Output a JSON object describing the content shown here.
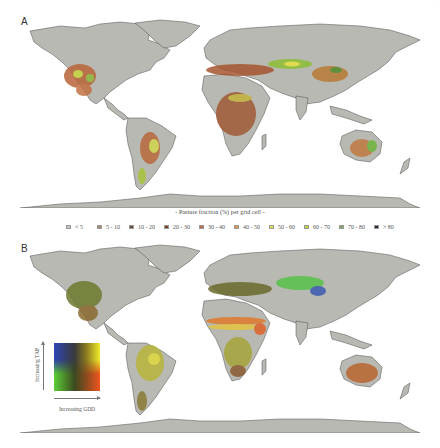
{
  "figure": {
    "corner_mark": "· ·"
  },
  "panels": [
    {
      "id": "A",
      "letter": "A",
      "description": "World map of pasture fraction per grid cell",
      "land_color": "#b9b9b4",
      "border_color": "#4a4a4a",
      "ocean_color": "#ffffff",
      "highlight_regions": [
        {
          "region": "western-north-america",
          "dominant_class": "30 - 40"
        },
        {
          "region": "south-america-southeast",
          "dominant_class": "50 - 60"
        },
        {
          "region": "central-asia-kazakhstan",
          "dominant_class": "50 - 60"
        },
        {
          "region": "africa-sahel-east",
          "dominant_class": "30 - 40"
        },
        {
          "region": "australia-east",
          "dominant_class": "60 - 70"
        },
        {
          "region": "mongolia-china",
          "dominant_class": "70 - 80"
        }
      ]
    },
    {
      "id": "B",
      "letter": "B",
      "description": "World map of pasture climate (GDD × TAP) bivariate colors",
      "land_color": "#b9b9b4",
      "border_color": "#4a4a4a",
      "ocean_color": "#ffffff",
      "highlight_regions": [
        {
          "region": "north-america-plains",
          "color": "#6c7a2e"
        },
        {
          "region": "sahel",
          "color": "#e07a2c"
        },
        {
          "region": "east-africa",
          "color": "#d9c341"
        },
        {
          "region": "south-america",
          "color": "#c8c43c"
        },
        {
          "region": "central-asia",
          "color": "#57c24a"
        },
        {
          "region": "tibet",
          "color": "#3b5bb0"
        },
        {
          "region": "australia",
          "color": "#b8652e"
        }
      ]
    }
  ],
  "legend_a": {
    "title": "- Pasture fraction (%) per grid cell -",
    "items": [
      {
        "label": "< 5",
        "color": "#c4c4c0"
      },
      {
        "label": "5 - 10",
        "color": "#a58a6d"
      },
      {
        "label": "10 - 20",
        "color": "#6a4a35"
      },
      {
        "label": "20 - 30",
        "color": "#7a3e26"
      },
      {
        "label": "30 - 40",
        "color": "#c2694a"
      },
      {
        "label": "40 - 50",
        "color": "#d9924a"
      },
      {
        "label": "50 - 60",
        "color": "#e6e24a"
      },
      {
        "label": "60 - 70",
        "color": "#b8d840"
      },
      {
        "label": "70 - 80",
        "color": "#7fa56a"
      },
      {
        "label": "> 80",
        "color": "#2a2a2a"
      }
    ]
  },
  "legend_b": {
    "y_label": "Increasing TAP",
    "x_label": "Increasing GDD",
    "corners": {
      "top_left": "#2f45b5",
      "top_right": "#f2ec2a",
      "bottom_left": "#5bcf36",
      "bottom_right": "#f0561e",
      "center": "#3c3220"
    }
  }
}
